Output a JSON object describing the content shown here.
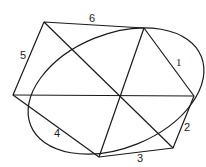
{
  "diagram": {
    "colors": {
      "line": "#1a1a1a",
      "text": "#222222",
      "background": "#ffffff"
    },
    "ellipse": {
      "cx": 116,
      "cy": 91,
      "rx": 92,
      "ry": 57,
      "rotation": -22
    },
    "hexagon_vertices": [
      {
        "id": "A",
        "x": 44,
        "y": 22
      },
      {
        "id": "B",
        "x": 144,
        "y": 28
      },
      {
        "id": "C",
        "x": 194,
        "y": 96
      },
      {
        "id": "D",
        "x": 173,
        "y": 148
      },
      {
        "id": "E",
        "x": 99,
        "y": 157
      },
      {
        "id": "F",
        "x": 13,
        "y": 95
      }
    ],
    "diagonals": [
      {
        "from": "A",
        "to": "D"
      },
      {
        "from": "B",
        "to": "E"
      },
      {
        "from": "F",
        "to": "C"
      }
    ],
    "side_labels": [
      {
        "text": "1",
        "x": 176,
        "y": 66
      },
      {
        "text": "2",
        "x": 184,
        "y": 131
      },
      {
        "text": "3",
        "x": 137,
        "y": 162
      },
      {
        "text": "4",
        "x": 54,
        "y": 137
      },
      {
        "text": "5",
        "x": 20,
        "y": 59
      },
      {
        "text": "6",
        "x": 89,
        "y": 22
      }
    ]
  }
}
